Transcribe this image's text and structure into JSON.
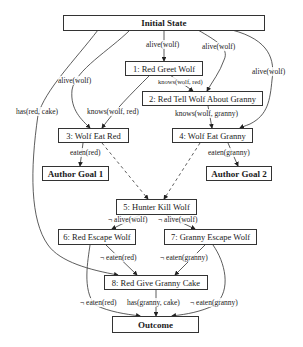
{
  "diagram": {
    "nodes": [
      {
        "id": "initial",
        "label": "Initial State",
        "bold": true
      },
      {
        "id": "n1",
        "label": "1: Red Greet Wolf"
      },
      {
        "id": "n2",
        "label": "2: Red Tell Wolf About Granny"
      },
      {
        "id": "n3",
        "label": "3: Wolf Eat Red"
      },
      {
        "id": "n4",
        "label": "4: Wolf Eat Granny"
      },
      {
        "id": "goal1",
        "label": "Author Goal 1",
        "bold": true
      },
      {
        "id": "goal2",
        "label": "Author Goal 2",
        "bold": true
      },
      {
        "id": "n5",
        "label": "5: Hunter Kill Wolf"
      },
      {
        "id": "n6",
        "label": "6: Red Escape Wolf"
      },
      {
        "id": "n7",
        "label": "7: Granny Escape Wolf"
      },
      {
        "id": "n8",
        "label": "8: Red Give Granny Cake"
      },
      {
        "id": "outcome",
        "label": "Outcome",
        "bold": true
      }
    ],
    "edge_labels": [
      {
        "from": "initial",
        "to": "n1",
        "label": "alive(wolf)"
      },
      {
        "from": "initial",
        "to": "n2",
        "label": "alive(wolf)"
      },
      {
        "from": "initial",
        "to": "n3",
        "label": "alive(wolf)"
      },
      {
        "from": "initial",
        "to": "n4",
        "label": "alive(wolf)"
      },
      {
        "from": "initial",
        "to": "n8",
        "label": "has(red, cake)"
      },
      {
        "from": "n1",
        "to": "n2",
        "label": "knows(wolf, red)"
      },
      {
        "from": "n1",
        "to": "n3",
        "label": "knows(wolf, red)"
      },
      {
        "from": "n2",
        "to": "n4",
        "label": "knows(wolf, granny)"
      },
      {
        "from": "n3",
        "to": "goal1",
        "label": "eaten(red)"
      },
      {
        "from": "n4",
        "to": "goal2",
        "label": "eaten(granny)"
      },
      {
        "from": "n5",
        "to": "n6",
        "label": "¬ alive(wolf)"
      },
      {
        "from": "n5",
        "to": "n7",
        "label": "¬ alive(wolf)"
      },
      {
        "from": "n6",
        "to": "n8",
        "label": "¬ eaten(red)"
      },
      {
        "from": "n7",
        "to": "n8",
        "label": "¬ eaten(granny)"
      },
      {
        "from": "n6",
        "to": "outcome",
        "label": "¬ eaten(red)"
      },
      {
        "from": "n8",
        "to": "outcome",
        "label": "has(granny, cake)"
      },
      {
        "from": "n7",
        "to": "outcome",
        "label": "¬ eaten(granny)"
      }
    ],
    "dashed_edges": [
      {
        "from": "n3",
        "to": "n5"
      },
      {
        "from": "n4",
        "to": "n5"
      }
    ]
  }
}
